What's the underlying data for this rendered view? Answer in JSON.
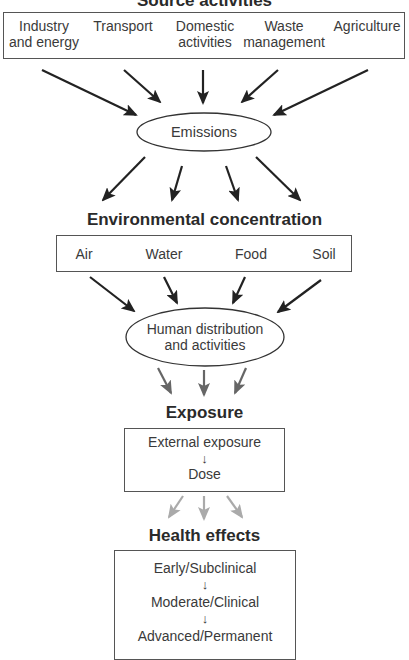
{
  "diagram": {
    "source": {
      "heading": "Source activities",
      "items": [
        {
          "line1": "Industry",
          "line2": "and energy"
        },
        {
          "line1": "Transport",
          "line2": ""
        },
        {
          "line1": "Domestic",
          "line2": "activities"
        },
        {
          "line1": "Waste",
          "line2": "management"
        },
        {
          "line1": "Agriculture",
          "line2": ""
        }
      ]
    },
    "emissions": {
      "label": "Emissions"
    },
    "environment": {
      "heading": "Environmental concentration",
      "items": [
        "Air",
        "Water",
        "Food",
        "Soil"
      ]
    },
    "human": {
      "line1": "Human distribution",
      "line2": "and activities"
    },
    "exposure": {
      "heading": "Exposure",
      "steps": [
        "External exposure",
        "Dose"
      ],
      "step_arrow": "↓"
    },
    "health": {
      "heading": "Health effects",
      "steps": [
        "Early/Subclinical",
        "Moderate/Clinical",
        "Advanced/Permanent"
      ],
      "step_arrow": "↓"
    },
    "colors": {
      "arrow_dark": "#222222",
      "arrow_medium": "#666666",
      "arrow_light": "#aaaaaa",
      "border": "#555555"
    }
  }
}
